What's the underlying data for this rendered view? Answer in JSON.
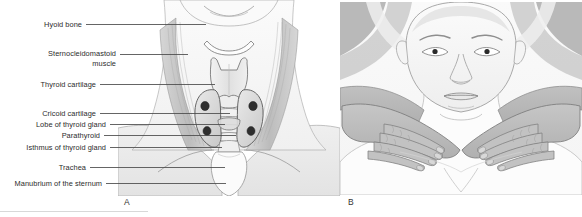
{
  "figure": {
    "panels": [
      {
        "letter": "A",
        "name": "anterior-neck-anatomy",
        "description": "Anterior view of the neck showing thyroid gland and related structures"
      },
      {
        "letter": "B",
        "name": "thyroid-palpation",
        "description": "Posterior approach palpation of the thyroid gland"
      }
    ],
    "labels": [
      {
        "id": "hyoid-bone",
        "text": "Hyoid bone",
        "lines": [
          "Hyoid bone"
        ]
      },
      {
        "id": "sternocleidomastoid-muscle",
        "text": "Sternocleidomastoid muscle",
        "lines": [
          "Sternocleidomastoid",
          "muscle"
        ]
      },
      {
        "id": "thyroid-cartilage",
        "text": "Thyroid cartilage",
        "lines": [
          "Thyroid cartilage"
        ]
      },
      {
        "id": "cricoid-cartilage",
        "text": "Cricoid cartilage",
        "lines": [
          "Cricoid cartilage"
        ]
      },
      {
        "id": "lobe-of-thyroid-gland",
        "text": "Lobe of thyroid gland",
        "lines": [
          "Lobe of thyroid gland"
        ]
      },
      {
        "id": "parathyroid",
        "text": "Parathyroid",
        "lines": [
          "Parathyroid"
        ]
      },
      {
        "id": "isthmus-of-thyroid-gland",
        "text": "Isthmus of thyroid gland",
        "lines": [
          "Isthmus of thyroid gland"
        ]
      },
      {
        "id": "trachea",
        "text": "Trachea",
        "lines": [
          "Trachea"
        ]
      },
      {
        "id": "manubrium-of-the-sternum",
        "text": "Manubrium of the sternum",
        "lines": [
          "Manubrium of the sternum"
        ]
      }
    ],
    "colors": {
      "background": "#ffffff",
      "label_text": "#2b2b2b",
      "leader_line": "#4a4a4a",
      "skin_light": "#f3f3f3",
      "skin_mid": "#e2e2e2",
      "muscle_shade": "#c9c9c9",
      "hand_shade": "#b6b6b6",
      "outline": "#6e6e6e",
      "parathyroid_dot": "#2f2f2f"
    }
  }
}
